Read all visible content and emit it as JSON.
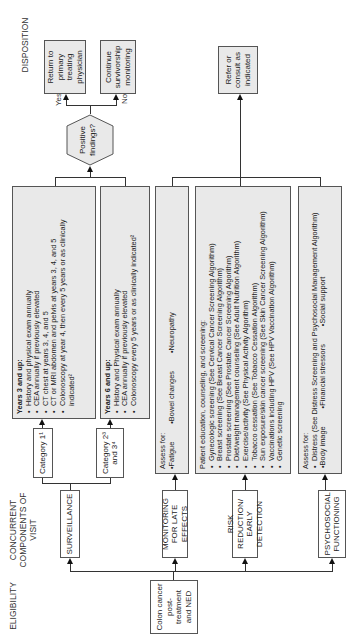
{
  "columns": {
    "eligibility": "ELIGIBILITY",
    "concurrent": "CONCURRENT COMPONENTS OF VISIT",
    "disposition": "DISPOSITION"
  },
  "eligibility_box": "Colon cancer post-treatment and NED",
  "components": {
    "surveillance": "SURVEILLANCE",
    "late_effects": "MONITORING FOR LATE EFFECTS",
    "risk_reduction": "RISK REDUCTION/ EARLY DETECTION",
    "psychosocial": "PSYCHOSOCIAL FUNCTIONING"
  },
  "categories": {
    "cat1": "Category 1¹",
    "cat234": "Category 2³ and 3⁴"
  },
  "surveillance_cat1": {
    "title": "Years 3 and up:",
    "items": [
      "History and physical exam annually",
      "CEA annually if previously elevated",
      "CT chest at years 3, 4, and 5",
      "CT or MRI abdomen and pelvis at years 3, 4, and 5",
      "Colonoscopy at year 4, then every 5 years or as clinically indicated²"
    ]
  },
  "surveillance_cat234": {
    "title": "Years 6 and up:",
    "items": [
      "History and Physical exam annually",
      "CEA annually if previously elevated",
      "Colonoscopy every 5 years or as clinically indicated²"
    ]
  },
  "late_effects_box": {
    "title": "Assess for:",
    "items": [
      "Fatigue",
      "Bowel changes",
      "Neuropathy"
    ]
  },
  "risk_box": {
    "title": "Patient education, counseling, and screening:",
    "items": [
      "Gynecologic screening (See Cervical Cancer Screening Algorithm)",
      "Breast screening (See Breast Cancer Screening Algorithm)",
      "Prostate screening (See Prostate Cancer Screening Algorithm)",
      "Diet/weight management counseling (See Adult Nutrition Algorithm)",
      "Exercise/activity (See Physical Activity Algorithm)",
      "Tobacco cessation (See Tobacco Cessation Algorithm)",
      "Sun exposure/skin cancer screening (See Skin Cancer Screening Algorithm)",
      "Vaccinations including HPV (See HPV Vaccination Algorithm)",
      "Genetic screening"
    ]
  },
  "psych_box": {
    "title": "Assess for:",
    "items": [
      "Distress (See Distress Screening and Psychosocial Management Algorithm)",
      "Body image",
      "Financial stressors",
      "Social support"
    ]
  },
  "decision": "Positive findings?",
  "branches": {
    "yes": "Yes",
    "no": "No"
  },
  "dispositions": {
    "return": "Return to primary treating physician",
    "continue": "Continue survivorship monitoring",
    "refer": "Refer or consult as indicated"
  }
}
